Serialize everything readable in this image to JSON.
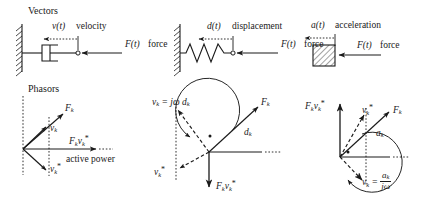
{
  "figure": {
    "width": 431,
    "height": 200,
    "background": "#ffffff",
    "ink": "#1a1a1a"
  },
  "row_labels": {
    "vectors": "Vectors",
    "phasors": "Phasors"
  },
  "top_row": {
    "panels": [
      {
        "id": "damper",
        "element_name": "dashpot-damper",
        "motion_symbol": "v(t)",
        "motion_word": "velocity",
        "force_symbol": "F(t)",
        "force_word": "force"
      },
      {
        "id": "spring",
        "element_name": "coil-spring",
        "motion_symbol": "d(t)",
        "motion_word": "displacement",
        "force_symbol": "F(t)",
        "force_word": "force"
      },
      {
        "id": "mass",
        "element_name": "hatched-mass-block",
        "motion_symbol": "a(t)",
        "motion_word": "acceleration",
        "force_symbol": "F(t)",
        "force_word": "force"
      }
    ]
  },
  "bottom_row": {
    "panels": [
      {
        "id": "damper-phasor",
        "force_label": "F",
        "force_sub": "k",
        "velocity_label": "v",
        "velocity_sub": "k",
        "conj_label": "v",
        "conj_sub": "k",
        "conj_star": "*",
        "power_label": "F",
        "power_sub1": "k",
        "power_v": "v",
        "power_sub2": "k",
        "power_star": "*",
        "caption": "active power"
      },
      {
        "id": "spring-phasor",
        "equation_lhs": "v",
        "equation_lhs_sub": "k",
        "equation_eq": " = ",
        "equation_rhs": "jω d",
        "equation_rhs_sub": "k",
        "force_label": "F",
        "force_sub": "k",
        "displacement_label": "d",
        "displacement_sub": "k",
        "conj_label": "v",
        "conj_sub": "k",
        "conj_star": "*",
        "power_label": "F",
        "power_sub1": "k",
        "power_v": "v",
        "power_sub2": "k",
        "power_star": "*"
      },
      {
        "id": "mass-phasor",
        "power_label": "F",
        "power_sub1": "k",
        "power_v": "v",
        "power_sub2": "k",
        "power_star": "*",
        "conj_label": "v",
        "conj_sub": "k",
        "conj_star": "*",
        "force_label": "F",
        "force_sub": "k",
        "accel_label": "a",
        "accel_sub": "k",
        "equation_lhs": "v",
        "equation_lhs_sub": "k",
        "equation_eq": " = ",
        "equation_num": "a",
        "equation_num_sub": "k",
        "equation_den": "jω"
      }
    ]
  }
}
